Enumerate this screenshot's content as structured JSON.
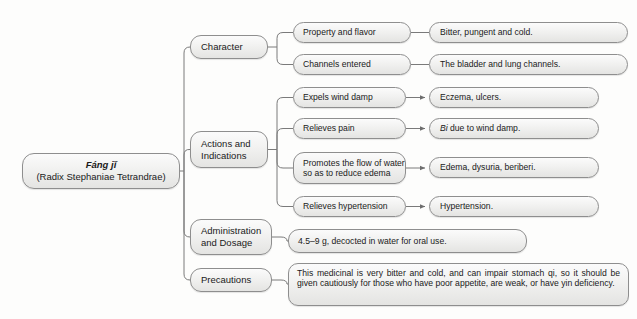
{
  "diagram": {
    "type": "mind-map",
    "root": {
      "line1": "Fáng jǐ",
      "line2": "(Radix Stephaniae Tetrandrae)"
    },
    "branches": {
      "character": {
        "label": "Character",
        "children": [
          {
            "label": "Property and flavor",
            "value": "Bitter, pungent and cold."
          },
          {
            "label": "Channels entered",
            "value": "The bladder and lung channels."
          }
        ]
      },
      "actions": {
        "label": "Actions and Indications",
        "label_line1": "Actions and",
        "label_line2": "Indications",
        "children": [
          {
            "label": "Expels wind damp",
            "value": "Eczema, ulcers."
          },
          {
            "label": "Relieves pain",
            "value_italic": "Bi",
            "value": " due to wind damp."
          },
          {
            "label_line1": "Promotes the flow of water",
            "label_line2": "so as to reduce edema",
            "label": "Promotes the flow of water so as to reduce edema",
            "value": "Edema, dysuria, beriberi."
          },
          {
            "label": "Relieves hypertension",
            "value": "Hypertension."
          }
        ]
      },
      "administration": {
        "label_line1": "Administration",
        "label_line2": "and Dosage",
        "label": "Administration and Dosage",
        "value": "4.5–9 g, decocted in water for oral use."
      },
      "precautions": {
        "label": "Precautions",
        "value": "This medicinal is very bitter and cold, and can impair stomach qi, so it should be given cautiously for those who have poor appetite, are weak, or have yin deficiency."
      }
    }
  },
  "colors": {
    "node_border": "#8e8e8e",
    "node_fill_top": "#fbfbfb",
    "node_fill_bottom": "#e4e4e2",
    "edge": "#7a7a7a",
    "text": "#1a1a1a",
    "background": "#fdfdfc"
  }
}
